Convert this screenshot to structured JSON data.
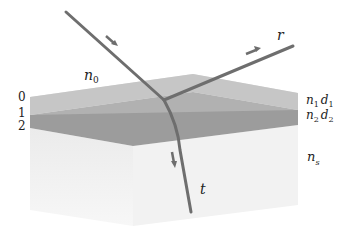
{
  "diagram": {
    "interfaces": [
      {
        "index": "0",
        "label": "0"
      },
      {
        "index": "1",
        "label": "1"
      },
      {
        "index": "2",
        "label": "2"
      }
    ],
    "media": {
      "ambient": {
        "n": "n",
        "sub": "0"
      },
      "layer1": {
        "n": "n",
        "n_sub": "1",
        "d": "d",
        "d_sub": "1"
      },
      "layer2": {
        "n": "n",
        "n_sub": "2",
        "d": "d",
        "d_sub": "2"
      },
      "substrate": {
        "n": "n",
        "sub": "s"
      }
    },
    "rays": {
      "reflected": {
        "label": "r"
      },
      "transmitted": {
        "label": "t"
      }
    },
    "colors": {
      "layer1_top": "#c4c4c4",
      "layer2": "#9a9a9a",
      "substrate": "#ececec",
      "ray": "#6e6e6e"
    }
  }
}
